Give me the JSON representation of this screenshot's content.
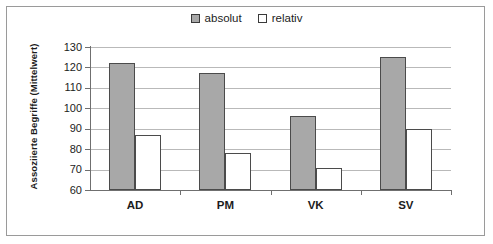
{
  "chart_data": {
    "type": "bar",
    "title": "",
    "xlabel": "",
    "ylabel": "Assoziierte Begriffe (Mittelwert)",
    "ylim": [
      60,
      130
    ],
    "ytick_step": 10,
    "yticks": [
      130,
      120,
      110,
      100,
      90,
      80,
      70,
      60
    ],
    "ytick_labels": [
      "130",
      "120",
      "110",
      "100",
      "90",
      "80",
      "70",
      "60"
    ],
    "grid": true,
    "legend_position": "top-center",
    "categories": [
      "AD",
      "PM",
      "VK",
      "SV"
    ],
    "series": [
      {
        "name": "absolut",
        "color": "#a8a8a8",
        "values": [
          122,
          117.5,
          96,
          125
        ]
      },
      {
        "name": "relativ",
        "color": "#ffffff",
        "values": [
          87,
          78,
          71,
          90
        ]
      }
    ]
  },
  "legend": {
    "entries": [
      {
        "label": "absolut",
        "swatch": "gray-filled-square-icon"
      },
      {
        "label": "relativ",
        "swatch": "white-outlined-square-icon"
      }
    ]
  },
  "axis": {
    "y_title": "Assoziierte Begriffe (Mittelwert)"
  }
}
